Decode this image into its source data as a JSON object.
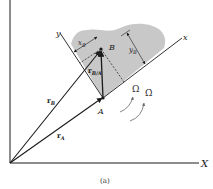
{
  "figure": {
    "caption": "(a)",
    "labels": {
      "X_axis": "X",
      "x_axis": "x",
      "y_axis": "y",
      "point_A": "A",
      "point_B": "B",
      "rA": "r",
      "rA_sub": "A",
      "rB": "r",
      "rB_sub": "B",
      "rBA": "r",
      "rBA_sub": "B/A",
      "xB": "x",
      "xB_sub": "B",
      "yB": "y",
      "yB_sub": "B",
      "omega": "Ω",
      "omega_dot": "Ω̇"
    },
    "colors": {
      "body_fill": "#c8c8c8",
      "line": "#1a1a1a"
    }
  }
}
